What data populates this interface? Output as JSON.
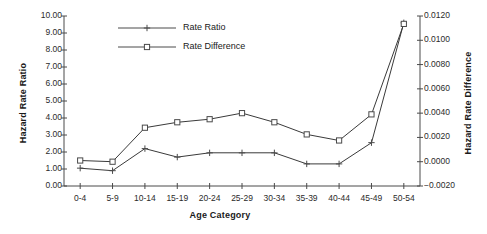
{
  "chart_data": {
    "type": "line",
    "title": "",
    "xlabel": "Age Category",
    "ylabel": "Hazard Rate Ratio",
    "ylabel_secondary": "Hazard Rate Difference",
    "categories": [
      "0-4",
      "5-9",
      "10-14",
      "15-19",
      "20-24",
      "25-29",
      "30-34",
      "35-39",
      "40-44",
      "45-49",
      "50-54"
    ],
    "ylim": [
      0.0,
      10.0
    ],
    "ytick_step": 1.0,
    "yticks": [
      "0.00",
      "1.00",
      "2.00",
      "3.00",
      "4.00",
      "5.00",
      "6.00",
      "7.00",
      "8.00",
      "9.00",
      "10.00"
    ],
    "ylim_secondary": [
      -0.002,
      0.012
    ],
    "ytick_step_secondary": 0.002,
    "yticks_secondary": [
      "-0.0020",
      "0.0000",
      "0.0020",
      "0.0040",
      "0.0060",
      "0.0080",
      "0.0100",
      "0.0120"
    ],
    "grid": false,
    "legend_position": "top-left-inside",
    "series": [
      {
        "name": "Rate Ratio",
        "axis": "left",
        "marker": "cross",
        "color": "#3a3a3a",
        "values": [
          1.05,
          0.9,
          2.2,
          1.7,
          1.95,
          1.95,
          1.95,
          1.3,
          1.3,
          2.55,
          9.6
        ]
      },
      {
        "name": "Rate Difference",
        "axis": "right",
        "marker": "square",
        "color": "#3a3a3a",
        "values": [
          0.0001,
          0.0,
          0.0028,
          0.00325,
          0.0035,
          0.004,
          0.00325,
          0.00225,
          0.00175,
          0.0039,
          0.01135
        ]
      }
    ]
  },
  "legend": {
    "items": [
      {
        "label": "Rate Ratio"
      },
      {
        "label": "Rate Difference"
      }
    ]
  }
}
